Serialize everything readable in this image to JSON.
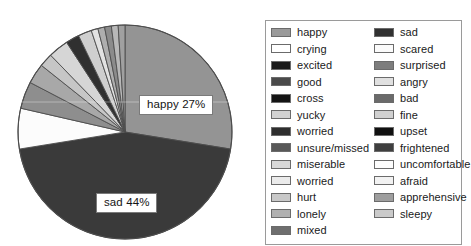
{
  "chart_data": {
    "type": "pie",
    "title": "",
    "legend_position": "right",
    "categories": [
      "happy",
      "sad",
      "crying",
      "scared",
      "excited",
      "surprised",
      "good",
      "angry",
      "cross",
      "bad",
      "yucky",
      "fine",
      "worried",
      "upset",
      "unsure/missed",
      "frightened",
      "miserable",
      "uncomfortable",
      "worried",
      "afraid",
      "hurt",
      "apprehensive",
      "lonely",
      "sleepy",
      "mixed"
    ],
    "values": [
      27,
      44,
      6,
      1,
      4,
      1,
      3,
      1,
      2,
      1,
      3,
      1,
      1,
      1,
      1,
      1,
      1,
      0,
      0,
      0,
      0,
      0,
      0,
      0,
      0
    ],
    "labeled_slices": [
      {
        "name": "happy",
        "label": "happy 27%",
        "percent": 27
      },
      {
        "name": "sad",
        "label": "sad 44%",
        "percent": 44
      }
    ],
    "slices": [
      {
        "name": "happy",
        "percent": 27,
        "color": "#949494"
      },
      {
        "name": "sad",
        "percent": 44,
        "color": "#3a3a3a"
      },
      {
        "name": "crying",
        "percent": 6,
        "color": "#fcfcfc"
      },
      {
        "name": "excited",
        "percent": 4,
        "color": "#8e8e8e"
      },
      {
        "name": "good",
        "percent": 3,
        "color": "#a8a8a8"
      },
      {
        "name": "cross",
        "percent": 2,
        "color": "#c6c6c6"
      },
      {
        "name": "yucky",
        "percent": 3,
        "color": "#d6d6d6"
      },
      {
        "name": "worried",
        "percent": 2,
        "color": "#303030"
      },
      {
        "name": "unsure",
        "percent": 2,
        "color": "#cfcfcf"
      },
      {
        "name": "miserable",
        "percent": 1,
        "color": "#e2e2e2"
      },
      {
        "name": "hurt",
        "percent": 1,
        "color": "#aeaeae"
      },
      {
        "name": "lonely",
        "percent": 1,
        "color": "#8b8b8b"
      },
      {
        "name": "mixed",
        "percent": 1,
        "color": "#b8b8b8"
      },
      {
        "name": "sleepy",
        "percent": 1,
        "color": "#a0a0a0"
      }
    ]
  },
  "legend": {
    "columns": [
      {
        "name": "legend-column-left",
        "items": [
          {
            "label": "happy",
            "color": "#9a9a9a"
          },
          {
            "label": "crying",
            "color": "#ffffff"
          },
          {
            "label": "excited",
            "color": "#1a1a1a"
          },
          {
            "label": "good",
            "color": "#4a4a4a"
          },
          {
            "label": "cross",
            "color": "#141414"
          },
          {
            "label": "yucky",
            "color": "#d2d2d2"
          },
          {
            "label": "worried",
            "color": "#2e2e2e"
          },
          {
            "label": "unsure/missed",
            "color": "#585858"
          },
          {
            "label": "miserable",
            "color": "#d8d8d8"
          },
          {
            "label": "worried",
            "color": "#ebebeb"
          },
          {
            "label": "hurt",
            "color": "#c8c8c8"
          },
          {
            "label": "lonely",
            "color": "#b0b0b0"
          },
          {
            "label": "mixed",
            "color": "#6e6e6e"
          }
        ]
      },
      {
        "name": "legend-column-right",
        "items": [
          {
            "label": "sad",
            "color": "#313131"
          },
          {
            "label": "scared",
            "color": "#fbfbfb"
          },
          {
            "label": "surprised",
            "color": "#7d7d7d"
          },
          {
            "label": "angry",
            "color": "#e0e0e0"
          },
          {
            "label": "bad",
            "color": "#6a6a6a"
          },
          {
            "label": "fine",
            "color": "#d0d0d0"
          },
          {
            "label": "upset",
            "color": "#101010"
          },
          {
            "label": "frightened",
            "color": "#3f3f3f"
          },
          {
            "label": "uncomfortable",
            "color": "#fdfdfd"
          },
          {
            "label": "afraid",
            "color": "#f2f2f2"
          },
          {
            "label": "apprehensive",
            "color": "#9e9e9e"
          },
          {
            "label": "sleepy",
            "color": "#cacaca"
          }
        ]
      }
    ]
  }
}
